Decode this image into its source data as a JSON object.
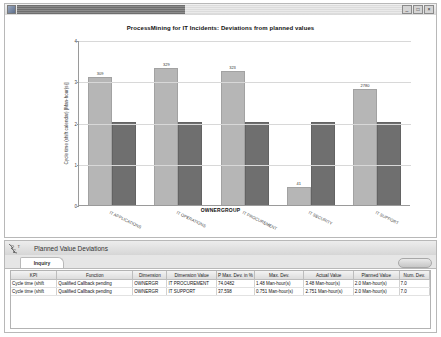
{
  "window": {
    "controls": {
      "minimize": "_",
      "maximize": "□",
      "close": "×"
    }
  },
  "chart_panel": {
    "title": "ProcessMining for IT Incidents: Deviations from planned values"
  },
  "chart_data": {
    "type": "bar",
    "title": "ProcessMining for IT Incidents: Deviations from planned values",
    "xlabel": "OWNERGROUP",
    "ylabel": "Cycle time (shift calendar) [Man-hour(s)]",
    "categories": [
      "IT APPLICATIONS",
      "IT OPERATIONS",
      "IT PROCUREMENT",
      "IT SECURITY",
      "IT SUPPORT"
    ],
    "series": [
      {
        "name": "Actual Value",
        "color": "#b6b6b6",
        "values": [
          3.09,
          3.29,
          3.23,
          0.41,
          2.78
        ],
        "labels": [
          "309",
          "329",
          "323",
          "41",
          "2780"
        ]
      },
      {
        "name": "Planned Value",
        "color": "#6f6f6f",
        "values": [
          2.0,
          2.0,
          2.0,
          2.0,
          2.0
        ],
        "labels": [
          "",
          "",
          "",
          "",
          ""
        ]
      }
    ],
    "ylim": [
      0,
      4
    ],
    "yticks": [
      "0",
      "1",
      "2",
      "3",
      "4"
    ],
    "grid": true,
    "legend": "none"
  },
  "lower_panel": {
    "title": "Planned Value Deviations",
    "tab": "Inquiry",
    "action_button": ""
  },
  "table": {
    "columns": [
      "KPI",
      "Function",
      "Dimension",
      "Dimension Value",
      "P Max. Dev. in %",
      "Max. Dev.",
      "Actual Value",
      "Planned Value",
      "Num. Dev."
    ],
    "rows": [
      {
        "kpi": "Cycle time (shift",
        "function": "Qualified Callback pending",
        "dimension": "OWNERGR",
        "dimension_value": "IT PROCUREMENT",
        "p_max_dev": "74.0482",
        "max_dev": "1.48 Man-hour(s)",
        "actual_value": "3.48 Man-hour(s)",
        "planned_value": "2.0 Man-hour(s)",
        "num_dev": "7.0"
      },
      {
        "kpi": "Cycle time (shift",
        "function": "Qualified Callback pending",
        "dimension": "OWNERGR",
        "dimension_value": "IT SUPPORT",
        "p_max_dev": "37.598",
        "max_dev": "0.751 Man-hour(s)",
        "actual_value": "2.751 Man-hour(s)",
        "planned_value": "2.0 Man-hour(s)",
        "num_dev": "7.0"
      }
    ]
  }
}
